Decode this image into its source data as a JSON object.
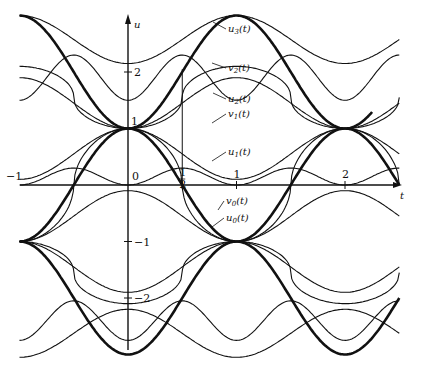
{
  "chart_data": {
    "type": "line",
    "title": "",
    "xlabel": "t",
    "ylabel": "u",
    "xlim": [
      -1,
      2.5
    ],
    "ylim": [
      -2.9,
      3.2
    ],
    "grid": false,
    "legend": "inline labels",
    "x_ticks": [
      {
        "value": -1,
        "label": "−1"
      },
      {
        "value": 0,
        "label": "0"
      },
      {
        "value": 0.5,
        "label": "1/2"
      },
      {
        "value": 1,
        "label": "1"
      },
      {
        "value": 2,
        "label": "2"
      }
    ],
    "y_ticks": [
      {
        "value": 2,
        "label": "2"
      },
      {
        "value": 1,
        "label": "1"
      },
      {
        "value": -1,
        "label": "−1"
      },
      {
        "value": -2,
        "label": "−2"
      }
    ],
    "guide_line": {
      "t": 0.5,
      "u_from": 0,
      "u_to": 2.05
    },
    "series": [
      {
        "name": "u3(t)",
        "label_sub": "3",
        "label_base": "u",
        "label_pos": [
          228,
          32
        ],
        "pointer_to": [
          213,
          22
        ]
      },
      {
        "name": "v2(t)",
        "label_sub": "2",
        "label_base": "v",
        "label_pos": [
          228,
          71
        ],
        "pointer_to": [
          212,
          63
        ]
      },
      {
        "name": "u2(t)",
        "label_sub": "2",
        "label_base": "u",
        "label_pos": [
          228,
          102
        ],
        "pointer_to": [
          213,
          93
        ]
      },
      {
        "name": "v1(t)",
        "label_sub": "1",
        "label_base": "v",
        "label_pos": [
          228,
          117
        ],
        "pointer_to": [
          212,
          123
        ]
      },
      {
        "name": "u1(t)",
        "label_sub": "1",
        "label_base": "u",
        "label_pos": [
          228,
          155
        ],
        "pointer_to": [
          212,
          161
        ]
      },
      {
        "name": "v0(t)",
        "label_sub": "0",
        "label_base": "v",
        "label_pos": [
          226,
          204
        ],
        "pointer_to": [
          218,
          210
        ]
      },
      {
        "name": "u0(t)",
        "label_sub": "0",
        "label_base": "u",
        "label_pos": [
          226,
          221
        ],
        "pointer_to": [
          212,
          227
        ]
      }
    ],
    "key_points": [
      {
        "t": 0,
        "u": 1,
        "note": "curves meet"
      },
      {
        "t": 1,
        "u": -1,
        "note": "curves meet"
      },
      {
        "t": 2,
        "u": 1,
        "note": "curves meet"
      },
      {
        "t": -1,
        "u": -1,
        "note": "curves meet"
      },
      {
        "t": 0.5,
        "u": 0,
        "note": "thick curve crosses axis"
      },
      {
        "t": 2.5,
        "u": 0,
        "note": "thick curve reaches axis end"
      }
    ]
  },
  "axes": {
    "t_label": "t",
    "u_label": "u"
  }
}
